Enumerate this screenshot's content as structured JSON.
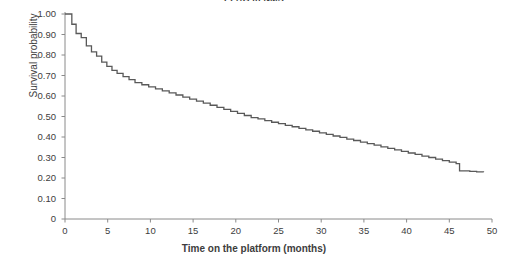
{
  "chart_data": {
    "type": "line",
    "subtype": "kaplan-meier-step",
    "title": "EPAG in NMS",
    "xlabel": "Time on the platform (months)",
    "ylabel": "Survival probability",
    "xlim": [
      0,
      50
    ],
    "ylim": [
      0,
      1.0
    ],
    "grid": false,
    "legend": null,
    "line_color": "#595959",
    "line_width": 1.3,
    "xticks": [
      0,
      5,
      10,
      15,
      20,
      25,
      30,
      35,
      40,
      45,
      50
    ],
    "xtick_labels": [
      "0",
      "5",
      "10",
      "15",
      "20",
      "25",
      "30",
      "35",
      "40",
      "45",
      "50"
    ],
    "yticks": [
      0,
      0.1,
      0.2,
      0.3,
      0.4,
      0.5,
      0.6,
      0.7,
      0.8,
      0.9,
      1.0
    ],
    "ytick_labels": [
      "0",
      "0.10",
      "0.20",
      "0.30",
      "0.40",
      "0.50",
      "0.60",
      "0.70",
      "0.80",
      "0.90",
      "1.00"
    ],
    "x": [
      0,
      0.8,
      1.3,
      1.9,
      2.5,
      3.1,
      3.7,
      4.3,
      4.9,
      5.5,
      6.1,
      6.8,
      7.5,
      8.2,
      9.0,
      9.8,
      10.6,
      11.4,
      12.2,
      13.0,
      13.8,
      14.6,
      15.4,
      16.2,
      17.0,
      17.8,
      18.6,
      19.4,
      20.2,
      21.0,
      21.8,
      22.6,
      23.4,
      24.2,
      25.0,
      25.8,
      26.6,
      27.4,
      28.2,
      29.0,
      29.8,
      30.6,
      31.4,
      32.2,
      33.0,
      33.8,
      34.6,
      35.4,
      36.2,
      37.0,
      37.8,
      38.6,
      39.4,
      40.2,
      41.0,
      41.8,
      42.6,
      43.4,
      44.2,
      45.0,
      45.8,
      46.2,
      47.4,
      48.2,
      49.0
    ],
    "y": [
      1.0,
      0.95,
      0.905,
      0.885,
      0.845,
      0.815,
      0.795,
      0.765,
      0.745,
      0.725,
      0.71,
      0.695,
      0.68,
      0.665,
      0.655,
      0.645,
      0.635,
      0.625,
      0.615,
      0.605,
      0.595,
      0.585,
      0.575,
      0.565,
      0.555,
      0.545,
      0.535,
      0.525,
      0.515,
      0.505,
      0.495,
      0.488,
      0.48,
      0.472,
      0.465,
      0.457,
      0.45,
      0.442,
      0.435,
      0.428,
      0.42,
      0.413,
      0.405,
      0.398,
      0.39,
      0.383,
      0.375,
      0.368,
      0.36,
      0.352,
      0.345,
      0.337,
      0.33,
      0.322,
      0.315,
      0.307,
      0.3,
      0.292,
      0.285,
      0.277,
      0.27,
      0.235,
      0.232,
      0.23,
      0.228
    ]
  },
  "axes": {
    "y_title": "Survival probability",
    "x_title": "Time on the platform (months)"
  },
  "title": {
    "text": "EPAG in NMS"
  }
}
